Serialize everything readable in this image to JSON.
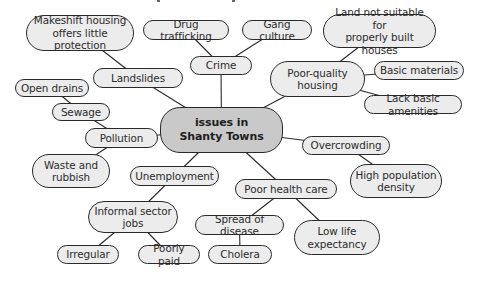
{
  "diagram": {
    "colors": {
      "node_fill": "#ececec",
      "central_fill": "#c9c9c9",
      "stroke": "#2a2a2a",
      "text": "#2b2b2b",
      "background": "#ffffff"
    },
    "central": {
      "id": "central",
      "label": "issues in\nShanty Towns"
    },
    "nodes": [
      {
        "id": "makeshift",
        "label": "Makeshift housing\noffers little protection",
        "box": [
          26,
          15,
          134,
          51
        ]
      },
      {
        "id": "drug",
        "label": "Drug trafficking",
        "box": [
          143,
          20,
          229,
          40
        ]
      },
      {
        "id": "gang",
        "label": "Gang culture",
        "box": [
          242,
          20,
          312,
          40
        ]
      },
      {
        "id": "land",
        "label": "Land not suitable for\nproperly built houses",
        "box": [
          323,
          14,
          436,
          48
        ]
      },
      {
        "id": "crime",
        "label": "Crime",
        "box": [
          190,
          56,
          252,
          75
        ]
      },
      {
        "id": "landslides",
        "label": "Landslides",
        "box": [
          93,
          68,
          183,
          88
        ]
      },
      {
        "id": "poorhousing",
        "label": "Poor-quality\nhousing",
        "box": [
          270,
          61,
          365,
          97
        ]
      },
      {
        "id": "basicmat",
        "label": "Basic materials",
        "box": [
          374,
          61,
          464,
          80
        ]
      },
      {
        "id": "opendrains",
        "label": "Open drains",
        "box": [
          15,
          79,
          89,
          97
        ]
      },
      {
        "id": "amenities",
        "label": "Lack basic amenities",
        "box": [
          364,
          95,
          462,
          114
        ]
      },
      {
        "id": "sewage",
        "label": "Sewage",
        "box": [
          52,
          103,
          110,
          121
        ]
      },
      {
        "id": "pollution",
        "label": "Pollution",
        "box": [
          85,
          128,
          158,
          148
        ]
      },
      {
        "id": "overcrowding",
        "label": "Overcrowding",
        "box": [
          302,
          136,
          390,
          155
        ]
      },
      {
        "id": "waste",
        "label": "Waste and\nrubbish",
        "box": [
          32,
          154,
          110,
          188
        ]
      },
      {
        "id": "unemployment",
        "label": "Unemployment",
        "box": [
          130,
          166,
          219,
          186
        ]
      },
      {
        "id": "density",
        "label": "High population\ndensity",
        "box": [
          350,
          164,
          442,
          198
        ]
      },
      {
        "id": "healthcare",
        "label": "Poor health care",
        "box": [
          235,
          179,
          337,
          199
        ]
      },
      {
        "id": "informal",
        "label": "Informal sector\njobs",
        "box": [
          88,
          201,
          178,
          233
        ]
      },
      {
        "id": "disease",
        "label": "Spread of disease",
        "box": [
          195,
          215,
          284,
          235
        ]
      },
      {
        "id": "lifeexp",
        "label": "Low life\nexpectancy",
        "box": [
          294,
          220,
          380,
          255
        ]
      },
      {
        "id": "irregular",
        "label": "Irregular",
        "box": [
          57,
          245,
          119,
          264
        ]
      },
      {
        "id": "poorlypaid",
        "label": "Poorly paid",
        "box": [
          138,
          245,
          200,
          264
        ]
      },
      {
        "id": "cholera",
        "label": "Cholera",
        "box": [
          208,
          245,
          272,
          264
        ]
      }
    ],
    "central_box": [
      160,
      107,
      283,
      153
    ],
    "edges": [
      [
        "central",
        "crime"
      ],
      [
        "central",
        "landslides"
      ],
      [
        "central",
        "poorhousing"
      ],
      [
        "central",
        "pollution"
      ],
      [
        "central",
        "overcrowding"
      ],
      [
        "central",
        "unemployment"
      ],
      [
        "central",
        "healthcare"
      ],
      [
        "crime",
        "drug"
      ],
      [
        "crime",
        "gang"
      ],
      [
        "landslides",
        "makeshift"
      ],
      [
        "poorhousing",
        "land"
      ],
      [
        "poorhousing",
        "basicmat"
      ],
      [
        "poorhousing",
        "amenities"
      ],
      [
        "pollution",
        "sewage"
      ],
      [
        "pollution",
        "waste"
      ],
      [
        "sewage",
        "opendrains"
      ],
      [
        "overcrowding",
        "density"
      ],
      [
        "unemployment",
        "informal"
      ],
      [
        "informal",
        "irregular"
      ],
      [
        "informal",
        "poorlypaid"
      ],
      [
        "healthcare",
        "disease"
      ],
      [
        "healthcare",
        "lifeexp"
      ],
      [
        "disease",
        "cholera"
      ]
    ]
  }
}
